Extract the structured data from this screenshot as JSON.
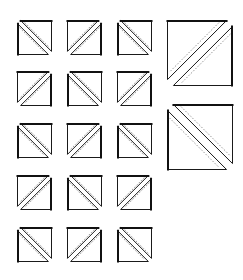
{
  "diagram": {
    "title": "",
    "colors": {
      "background": "#ffffff",
      "outline": "#1a1a1a",
      "seam": "#555555"
    },
    "small_units": {
      "size": 35,
      "columns_x": [
        17,
        67,
        117
      ],
      "rows_y": [
        20,
        71,
        123,
        175,
        227
      ],
      "grid": [
        [
          "\\",
          "/",
          "\\"
        ],
        [
          "/",
          "\\",
          "/"
        ],
        [
          "\\",
          "/",
          "\\"
        ],
        [
          "/",
          "\\",
          "/"
        ],
        [
          "\\",
          "/",
          "\\"
        ]
      ]
    },
    "large_units": [
      {
        "x": 167,
        "y": 20,
        "size": 66,
        "diagonal": "/"
      },
      {
        "x": 167,
        "y": 104,
        "size": 66,
        "diagonal": "\\"
      }
    ]
  }
}
